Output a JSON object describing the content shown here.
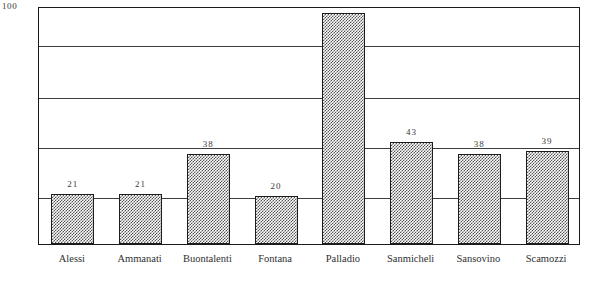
{
  "chart_data": {
    "type": "bar",
    "title": "",
    "xlabel": "",
    "ylabel": "",
    "ylim": [
      0,
      100
    ],
    "grid": true,
    "legend": false,
    "y_axis_top_label": "100",
    "gridline_values": [
      84,
      62,
      41,
      20
    ],
    "categories": [
      "Alessi",
      "Ammanati",
      "Buontalenti",
      "Fontana",
      "Palladio",
      "Sanmicheli",
      "Sansovino",
      "Scamozzi"
    ],
    "values": [
      21,
      21,
      38,
      20,
      97,
      43,
      38,
      39
    ],
    "value_labels": [
      "21",
      "21",
      "38",
      "20",
      "",
      "43",
      "38",
      "39"
    ]
  },
  "axis": {
    "y_max_label": "100"
  }
}
